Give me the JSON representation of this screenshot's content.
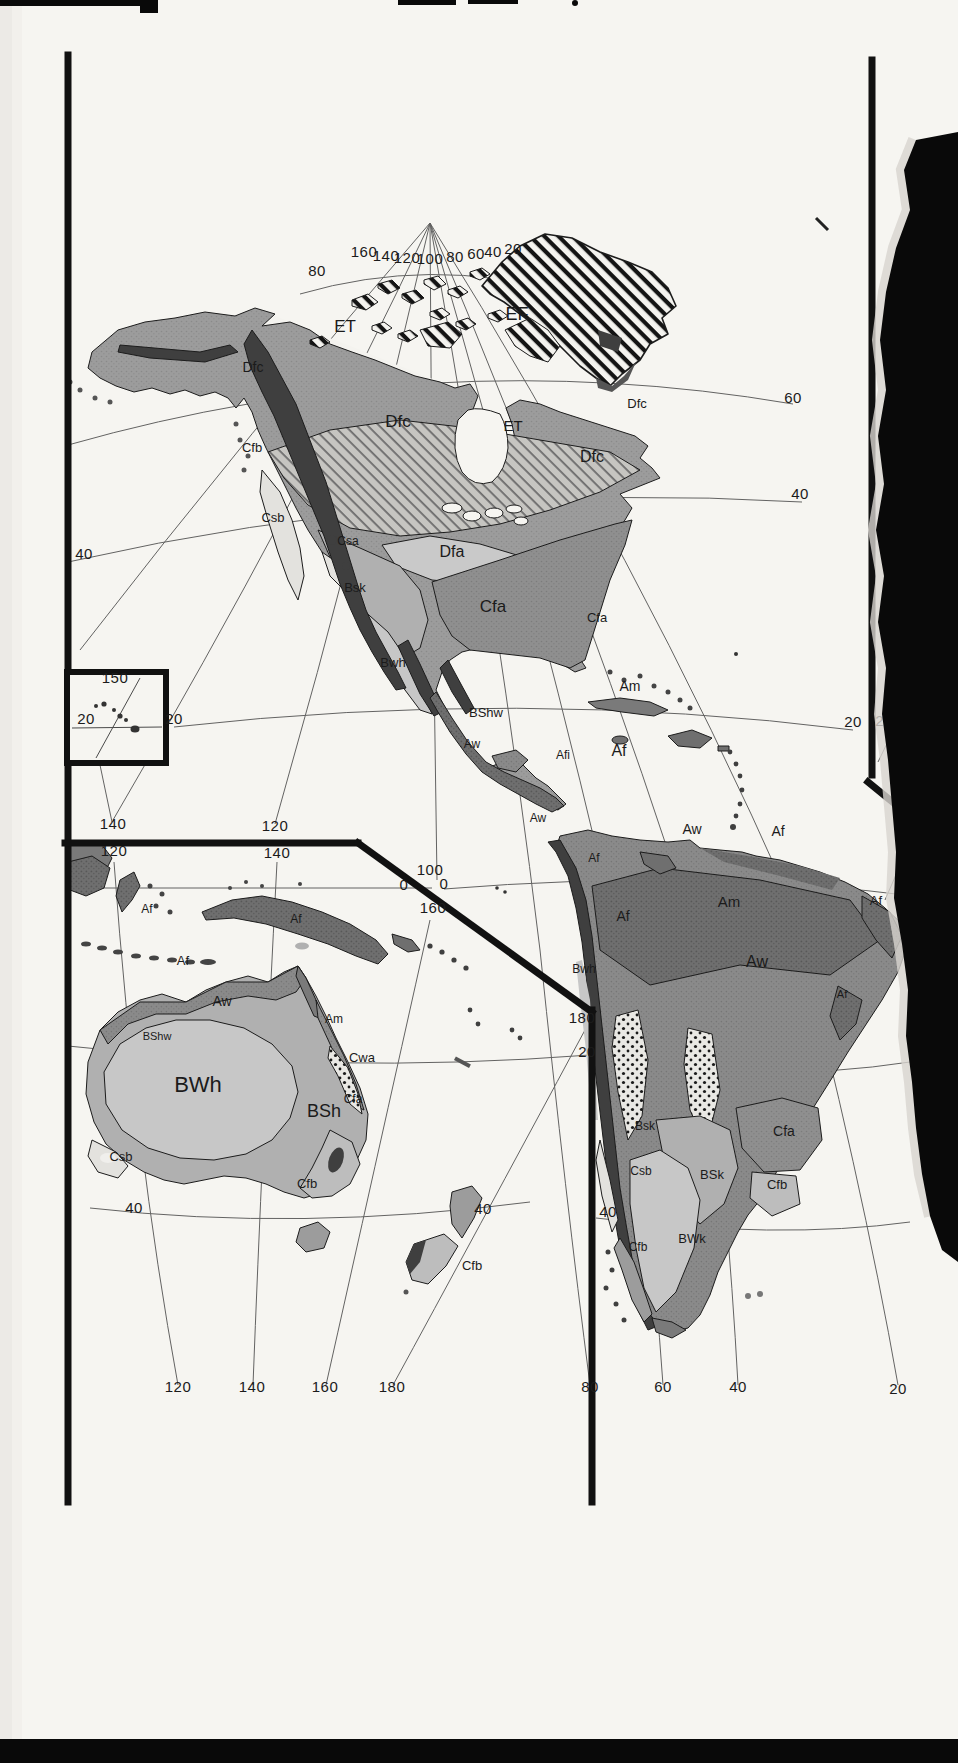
{
  "document": {
    "kind": "Scanned atlas page — Köppen climate classification map",
    "panels": [
      "North America",
      "South America",
      "Australia and Oceania inset",
      "Hawaii inset"
    ]
  },
  "colors": {
    "page": "#f6f5f1",
    "ink": "#1b1b1b",
    "tropical_wet_AfAm": "#6f6f6f",
    "savanna_Aw": "#8a8a8a",
    "subarctic_Dfc": "#9c9c9c",
    "humid_subtropical_Cfa": "#8f8f8f",
    "continental_Dfa": "#c9c9c9",
    "steppe_BS": "#b0b0b0",
    "desert_BW": "#c7c7c7",
    "mediterranean_Cs": "#e3e2de",
    "oceanic_Cfb": "#bdbdbd",
    "highland": "#3f3f3f",
    "tear_black": "#090909"
  },
  "labels": {
    "climate": [
      {
        "t": "ET",
        "x": 345,
        "y": 332,
        "s": 17
      },
      {
        "t": "EF",
        "x": 517,
        "y": 320,
        "s": 18
      },
      {
        "t": "Dfc",
        "x": 253,
        "y": 372,
        "s": 14
      },
      {
        "t": "Dfc",
        "x": 398,
        "y": 427,
        "s": 17
      },
      {
        "t": "Cfb",
        "x": 252,
        "y": 452,
        "s": 13
      },
      {
        "t": "ET",
        "x": 513,
        "y": 431,
        "s": 15
      },
      {
        "t": "Dfc",
        "x": 637,
        "y": 408,
        "s": 13
      },
      {
        "t": "Dfc",
        "x": 592,
        "y": 462,
        "s": 16
      },
      {
        "t": "Csb",
        "x": 273,
        "y": 522,
        "s": 13
      },
      {
        "t": "Csa",
        "x": 348,
        "y": 545,
        "s": 12
      },
      {
        "t": "Dfa",
        "x": 452,
        "y": 557,
        "s": 16
      },
      {
        "t": "Bsk",
        "x": 355,
        "y": 592,
        "s": 13
      },
      {
        "t": "Cfa",
        "x": 493,
        "y": 612,
        "s": 17
      },
      {
        "t": "Cfa",
        "x": 597,
        "y": 622,
        "s": 13
      },
      {
        "t": "Bwh",
        "x": 393,
        "y": 667,
        "s": 13
      },
      {
        "t": "BShw",
        "x": 486,
        "y": 717,
        "s": 13
      },
      {
        "t": "Am",
        "x": 630,
        "y": 691,
        "s": 14
      },
      {
        "t": "Aw",
        "x": 472,
        "y": 748,
        "s": 12
      },
      {
        "t": "Afi",
        "x": 563,
        "y": 759,
        "s": 12
      },
      {
        "t": "Af",
        "x": 619,
        "y": 756,
        "s": 16
      },
      {
        "t": "Aw",
        "x": 538,
        "y": 822,
        "s": 12
      },
      {
        "t": "Af",
        "x": 594,
        "y": 862,
        "s": 12
      },
      {
        "t": "Aw",
        "x": 692,
        "y": 834,
        "s": 14
      },
      {
        "t": "Af",
        "x": 778,
        "y": 836,
        "s": 14
      },
      {
        "t": "Af",
        "x": 876,
        "y": 905,
        "s": 13
      },
      {
        "t": "Am",
        "x": 729,
        "y": 907,
        "s": 15
      },
      {
        "t": "Af",
        "x": 623,
        "y": 921,
        "s": 14
      },
      {
        "t": "Aw",
        "x": 757,
        "y": 967,
        "s": 16
      },
      {
        "t": "B",
        "x": 911,
        "y": 963,
        "s": 12,
        "light": true
      },
      {
        "t": "Af",
        "x": 842,
        "y": 998,
        "s": 11
      },
      {
        "t": "Bwh",
        "x": 584,
        "y": 973,
        "s": 12
      },
      {
        "t": "Bsk",
        "x": 645,
        "y": 1130,
        "s": 12
      },
      {
        "t": "Csb",
        "x": 641,
        "y": 1175,
        "s": 12
      },
      {
        "t": "BSk",
        "x": 712,
        "y": 1179,
        "s": 13
      },
      {
        "t": "Cfa",
        "x": 784,
        "y": 1136,
        "s": 14
      },
      {
        "t": "Cfb",
        "x": 777,
        "y": 1189,
        "s": 13
      },
      {
        "t": "Cfb",
        "x": 638,
        "y": 1251,
        "s": 12
      },
      {
        "t": "BWk",
        "x": 692,
        "y": 1243,
        "s": 13
      },
      {
        "t": "Cfb",
        "x": 472,
        "y": 1270,
        "s": 13
      },
      {
        "t": "Af",
        "x": 147,
        "y": 913,
        "s": 12
      },
      {
        "t": "Af",
        "x": 296,
        "y": 923,
        "s": 12
      },
      {
        "t": "Af",
        "x": 183,
        "y": 965,
        "s": 13
      },
      {
        "t": "Aw",
        "x": 222,
        "y": 1006,
        "s": 14
      },
      {
        "t": "Am",
        "x": 334,
        "y": 1023,
        "s": 12
      },
      {
        "t": "BShw",
        "x": 157,
        "y": 1040,
        "s": 11
      },
      {
        "t": "Cwa",
        "x": 362,
        "y": 1062,
        "s": 13
      },
      {
        "t": "BWh",
        "x": 198,
        "y": 1092,
        "s": 22
      },
      {
        "t": "BSh",
        "x": 324,
        "y": 1117,
        "s": 18
      },
      {
        "t": "Cfa",
        "x": 353,
        "y": 1103,
        "s": 12
      },
      {
        "t": "Csb",
        "x": 121,
        "y": 1161,
        "s": 13
      },
      {
        "t": "Cfb",
        "x": 307,
        "y": 1188,
        "s": 13
      }
    ],
    "coordinates": [
      {
        "t": "160",
        "x": 364,
        "y": 257,
        "s": 15
      },
      {
        "t": "140",
        "x": 386,
        "y": 261,
        "s": 15
      },
      {
        "t": "120",
        "x": 407,
        "y": 263,
        "s": 15
      },
      {
        "t": "100",
        "x": 430,
        "y": 264,
        "s": 15
      },
      {
        "t": "80",
        "x": 455,
        "y": 262,
        "s": 15
      },
      {
        "t": "60",
        "x": 476,
        "y": 259,
        "s": 15
      },
      {
        "t": "40",
        "x": 493,
        "y": 257,
        "s": 15
      },
      {
        "t": "20",
        "x": 513,
        "y": 254,
        "s": 15
      },
      {
        "t": "80",
        "x": 317,
        "y": 276,
        "s": 15
      },
      {
        "t": "60",
        "x": 793,
        "y": 403,
        "s": 15
      },
      {
        "t": "40",
        "x": 84,
        "y": 559,
        "s": 15
      },
      {
        "t": "40",
        "x": 800,
        "y": 499,
        "s": 15
      },
      {
        "t": "20",
        "x": 174,
        "y": 724,
        "s": 15
      },
      {
        "t": "20",
        "x": 853,
        "y": 727,
        "s": 15
      },
      {
        "t": "20",
        "x": 884,
        "y": 726,
        "s": 15
      },
      {
        "t": "150",
        "x": 115,
        "y": 683,
        "s": 15
      },
      {
        "t": "20",
        "x": 86,
        "y": 724,
        "s": 15
      },
      {
        "t": "140",
        "x": 113,
        "y": 829,
        "s": 15
      },
      {
        "t": "120",
        "x": 275,
        "y": 831,
        "s": 15
      },
      {
        "t": "120",
        "x": 114,
        "y": 856,
        "s": 15
      },
      {
        "t": "140",
        "x": 277,
        "y": 858,
        "s": 15
      },
      {
        "t": "100",
        "x": 430,
        "y": 875,
        "s": 15
      },
      {
        "t": "0",
        "x": 404,
        "y": 890,
        "s": 15
      },
      {
        "t": "0",
        "x": 444,
        "y": 889,
        "s": 15
      },
      {
        "t": "160",
        "x": 433,
        "y": 913,
        "s": 15
      },
      {
        "t": "180",
        "x": 582,
        "y": 1023,
        "s": 15
      },
      {
        "t": "20",
        "x": 587,
        "y": 1057,
        "s": 15
      },
      {
        "t": "40",
        "x": 134,
        "y": 1213,
        "s": 15
      },
      {
        "t": "40",
        "x": 483,
        "y": 1214,
        "s": 15
      },
      {
        "t": "40",
        "x": 608,
        "y": 1217,
        "s": 15
      },
      {
        "t": "120",
        "x": 178,
        "y": 1392,
        "s": 15
      },
      {
        "t": "140",
        "x": 252,
        "y": 1392,
        "s": 15
      },
      {
        "t": "160",
        "x": 325,
        "y": 1392,
        "s": 15
      },
      {
        "t": "180",
        "x": 392,
        "y": 1392,
        "s": 15
      },
      {
        "t": "80",
        "x": 590,
        "y": 1392,
        "s": 15
      },
      {
        "t": "60",
        "x": 663,
        "y": 1392,
        "s": 15
      },
      {
        "t": "40",
        "x": 738,
        "y": 1392,
        "s": 15
      },
      {
        "t": "20",
        "x": 898,
        "y": 1394,
        "s": 15
      }
    ]
  }
}
